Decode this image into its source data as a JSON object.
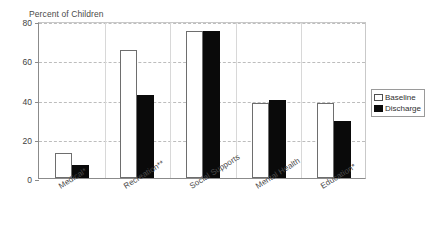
{
  "chart_data": {
    "type": "bar",
    "title": "Percent of Children",
    "xlabel": "",
    "ylabel": "",
    "ylim": [
      0,
      80
    ],
    "yticks": [
      0,
      20,
      40,
      60,
      80
    ],
    "grid": "horizontal-dashed",
    "legend_position": "right",
    "categories": [
      "Medical*",
      "Recreation**",
      "Social Supports",
      "Mental Health",
      "Education*"
    ],
    "series": [
      {
        "name": "Baseline",
        "color": "#ffffff",
        "values": [
          13,
          65,
          75,
          38,
          38
        ]
      },
      {
        "name": "Discharge",
        "color": "#0a0a0a",
        "values": [
          6.5,
          42.5,
          75,
          40,
          29
        ]
      }
    ]
  },
  "legend": {
    "items": [
      {
        "label": "Baseline"
      },
      {
        "label": "Discharge"
      }
    ]
  }
}
